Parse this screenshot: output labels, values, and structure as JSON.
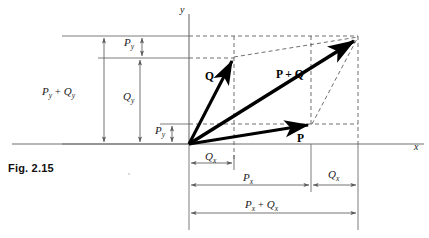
{
  "figure": {
    "caption": "Fig. 2.15",
    "axes": {
      "x_label": "x",
      "y_label": "y"
    },
    "vectors": [
      {
        "name": "Q",
        "label": "Q",
        "from": [
          189,
          144
        ],
        "to": [
          234,
          57
        ]
      },
      {
        "name": "P",
        "label": "P",
        "from": [
          189,
          144
        ],
        "to": [
          312,
          124
        ]
      },
      {
        "name": "P-plus-Q",
        "label": "P + Q",
        "from": [
          189,
          144
        ],
        "to": [
          358,
          37
        ]
      }
    ],
    "vector_label_positions": {
      "Q": [
        207,
        76
      ],
      "P": [
        300,
        139
      ],
      "P_plus_Q": [
        279,
        78
      ]
    },
    "dimensions": {
      "vertical": [
        {
          "name": "Py-top",
          "base": "P",
          "sub": "y",
          "text": "P",
          "sub_text": "y",
          "x": 142,
          "y1": 36,
          "y2": 58
        },
        {
          "name": "Qy",
          "base": "Q",
          "sub": "y",
          "text": "Q",
          "sub_text": "y",
          "x": 140,
          "y1": 58,
          "y2": 144
        },
        {
          "name": "Py-bottom",
          "base": "P",
          "sub": "y",
          "text": "P",
          "sub_text": "y",
          "x": 172,
          "y1": 124,
          "y2": 144
        },
        {
          "name": "Py-plus-Qy",
          "base": "P + Q",
          "sub": "y",
          "text": "P",
          "sub_text": "y",
          "x": 104,
          "y1": 36,
          "y2": 144
        }
      ],
      "horizontal": [
        {
          "name": "Qx-left",
          "text": "Q",
          "sub_text": "x",
          "y": 163,
          "x1": 189,
          "x2": 234
        },
        {
          "name": "Px",
          "text": "P",
          "sub_text": "x",
          "y": 185,
          "x1": 189,
          "x2": 311
        },
        {
          "name": "Qx-right",
          "text": "Q",
          "sub_text": "x",
          "y": 185,
          "x1": 311,
          "x2": 358
        },
        {
          "name": "Px-plus-Qx",
          "text": "P",
          "sub_text": "x",
          "y": 213,
          "x1": 189,
          "x2": 358
        }
      ]
    },
    "labels": {
      "Py": "P",
      "Qy": "Q",
      "Px": "P",
      "Qx": "Q",
      "sub_y": "y",
      "sub_x": "x",
      "plus": "+",
      "Py_plus_Qy_main": "P",
      "Py_plus_Qy_second": "Q",
      "Px_plus_Qx_main": "P",
      "Px_plus_Qx_second": "Q"
    },
    "colors": {
      "vector": "#000000",
      "axis": "#6e6e6e",
      "dimension": "#5a5a5a",
      "dashed": "#555555",
      "text": "#1a1a1a"
    }
  }
}
